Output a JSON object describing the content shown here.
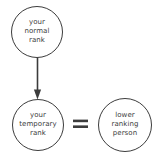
{
  "diagram": {
    "background_color": "#ffffff",
    "stroke_color": "#3c3c3c",
    "text_color": "#3c3c3c",
    "nodes": [
      {
        "id": "normal-rank",
        "shape": "circle",
        "cx": 37,
        "cy": 32,
        "r": 25.5,
        "lines": [
          "your",
          "normal",
          "rank"
        ],
        "line1": "your",
        "line2": "normal",
        "line3": "rank"
      },
      {
        "id": "temporary-rank",
        "shape": "circle",
        "cx": 38,
        "cy": 125,
        "r": 25.5,
        "lines": [
          "your",
          "temporary",
          "rank"
        ],
        "line1": "your",
        "line2": "temporary",
        "line3": "rank"
      },
      {
        "id": "lower-ranking-person",
        "shape": "circle",
        "cx": 125,
        "cy": 125,
        "r": 26.5,
        "lines": [
          "lower",
          "ranking",
          "person"
        ],
        "line1": "lower",
        "line2": "ranking",
        "line3": "person"
      }
    ],
    "connectors": [
      {
        "id": "normal-to-temporary-arrow",
        "type": "arrow",
        "from": "normal-rank",
        "to": "temporary-rank",
        "direction": "down"
      }
    ],
    "operators": [
      {
        "id": "equals-operator",
        "symbol": "=",
        "between": [
          "temporary-rank",
          "lower-ranking-person"
        ]
      }
    ]
  }
}
